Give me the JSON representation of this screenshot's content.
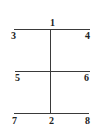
{
  "diagram": {
    "type": "frame-structure",
    "line_color": "#3a3a3a",
    "text_color": "#222222",
    "lines": [
      {
        "name": "top-beam",
        "x1": 14,
        "y1": 30,
        "x2": 90,
        "y2": 30
      },
      {
        "name": "middle-beam",
        "x1": 15,
        "y1": 72,
        "x2": 90,
        "y2": 72
      },
      {
        "name": "bottom-beam",
        "x1": 14,
        "y1": 114,
        "x2": 89,
        "y2": 114
      },
      {
        "name": "vertical-column",
        "x1": 51,
        "y1": 30,
        "x2": 51,
        "y2": 114
      }
    ],
    "labels": {
      "n1": "1",
      "n2": "2",
      "n3": "3",
      "n4": "4",
      "n5": "5",
      "n6": "6",
      "n7": "7",
      "n8": "8"
    }
  }
}
